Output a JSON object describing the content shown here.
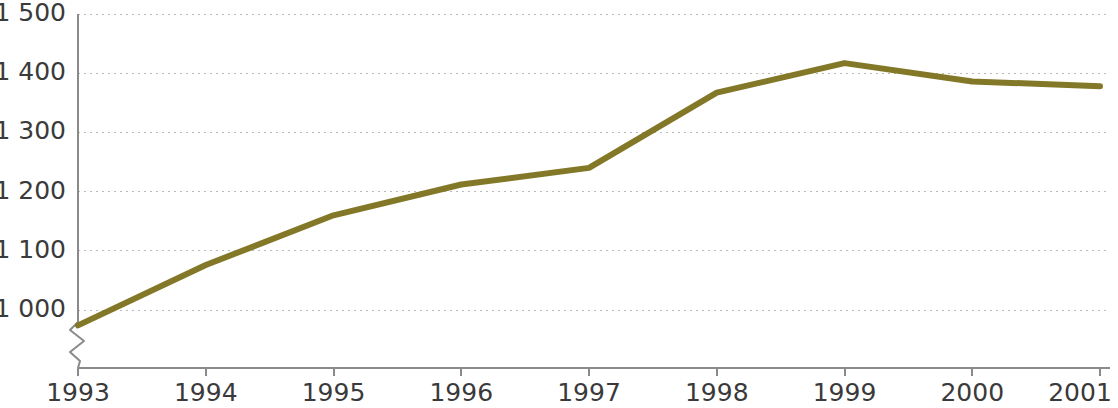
{
  "chart_data": {
    "type": "line",
    "title": "",
    "subtitle": "",
    "xlabel": "",
    "ylabel": "",
    "categories": [
      "1993",
      "1994",
      "1995",
      "1996",
      "1997",
      "1998",
      "1999",
      "2000",
      "2001"
    ],
    "x": [
      1993,
      1994,
      1995,
      1996,
      1997,
      1998,
      1999,
      2000,
      2001
    ],
    "values": [
      974,
      1076,
      1160,
      1212,
      1240,
      1367,
      1417,
      1386,
      1378
    ],
    "series": [
      {
        "name": "",
        "values": [
          974,
          1076,
          1160,
          1212,
          1240,
          1367,
          1417,
          1386,
          1378
        ],
        "color": "#827828"
      }
    ],
    "ylim": [
      974,
      1500
    ],
    "ytick_values": [
      1000,
      1100,
      1200,
      1300,
      1400,
      1500
    ],
    "ytick_labels": [
      "1 000",
      "1 100",
      "1 200",
      "1 300",
      "1 400",
      "1 500"
    ],
    "xtick_labels": [
      "1993",
      "1994",
      "1995",
      "1996",
      "1997",
      "1998",
      "1999",
      "2000",
      "2001"
    ],
    "grid": true,
    "grid_axis": "y",
    "grid_style": "dotted",
    "legend": false,
    "legend_position": "none",
    "axis_break": true,
    "annotations": []
  },
  "style": {
    "line_color": "#827828",
    "grid_color": "#b9b9b9",
    "axis_color": "#8a8a8a",
    "text_color": "#3a3a3a",
    "background": "#ffffff"
  }
}
